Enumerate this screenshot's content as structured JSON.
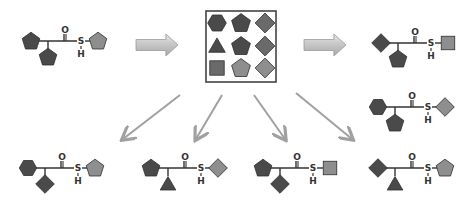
{
  "diagram": {
    "atom_labels": {
      "oxygen": "O",
      "sulfur": "S",
      "hydrogen": "H"
    },
    "colors": {
      "shape_dark": "#4a4a4a",
      "shape_mid": "#6a6a6a",
      "shape_light": "#8e8e8e",
      "arrow": "#a0a0a0",
      "bond": "#333333",
      "box_border": "#444444"
    },
    "start_molecule": {
      "left": "pentagon",
      "bottom": "pentagon",
      "right": "pentagon"
    },
    "library_grid": [
      [
        "hexagon",
        "pentagon",
        "diamond"
      ],
      [
        "triangle",
        "pentagon",
        "diamond"
      ],
      [
        "square",
        "pentagon",
        "diamond"
      ]
    ],
    "products_right": [
      {
        "left": "diamond",
        "bottom": "pentagon",
        "right": "square"
      },
      {
        "left": "hexagon",
        "bottom": "pentagon",
        "right": "diamond"
      }
    ],
    "products_bottom": [
      {
        "left": "hexagon",
        "bottom": "diamond",
        "right": "pentagon"
      },
      {
        "left": "pentagon",
        "bottom": "triangle",
        "right": "diamond"
      },
      {
        "left": "pentagon",
        "bottom": "diamond",
        "right": "square"
      },
      {
        "left": "diamond",
        "bottom": "triangle",
        "right": "pentagon"
      }
    ]
  }
}
